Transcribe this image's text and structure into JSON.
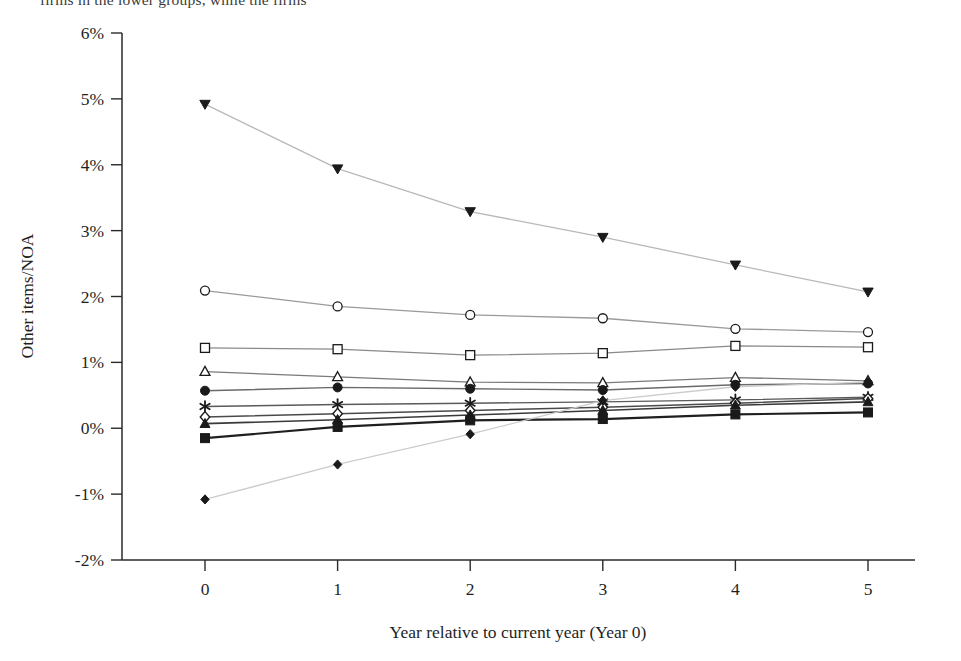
{
  "page": {
    "clipped_caption": "firms in the lower groups, while the firms"
  },
  "chart_data": {
    "type": "line",
    "title": "",
    "xlabel": "Year relative to current year (Year 0)",
    "ylabel": "Other items/NOA",
    "x": [
      0,
      1,
      2,
      3,
      4,
      5
    ],
    "xtick_labels": [
      "0",
      "1",
      "2",
      "3",
      "4",
      "5"
    ],
    "ytick_labels": [
      "6%",
      "5%",
      "4%",
      "3%",
      "2%",
      "1%",
      "0%",
      "-1%",
      "-2%"
    ],
    "ytick_values": [
      6,
      5,
      4,
      3,
      2,
      1,
      0,
      -1,
      -2
    ],
    "ylim": [
      -2,
      6
    ],
    "xlim": [
      -0.55,
      5.55
    ],
    "yunit": "percent",
    "grid": false,
    "legend": "none",
    "series": [
      {
        "name": "Portfolio 10",
        "marker": "triangle-down-filled",
        "color": "#1a1a1a",
        "line_color": "#b8b8b8",
        "line_width": 1.3,
        "marker_size": 9,
        "values": [
          4.92,
          3.94,
          3.29,
          2.9,
          2.48,
          2.07
        ]
      },
      {
        "name": "Portfolio 9",
        "marker": "circle-open",
        "color": "#1a1a1a",
        "line_color": "#9a9a9a",
        "line_width": 1.3,
        "marker_size": 9,
        "values": [
          2.09,
          1.85,
          1.72,
          1.67,
          1.51,
          1.46
        ]
      },
      {
        "name": "Portfolio 8",
        "marker": "square-open",
        "color": "#1a1a1a",
        "line_color": "#8a8a8a",
        "line_width": 1.3,
        "marker_size": 9,
        "values": [
          1.22,
          1.2,
          1.11,
          1.14,
          1.25,
          1.23
        ]
      },
      {
        "name": "Portfolio 7",
        "marker": "triangle-up-open",
        "color": "#1a1a1a",
        "line_color": "#7a7a7a",
        "line_width": 1.3,
        "marker_size": 9,
        "values": [
          0.86,
          0.78,
          0.7,
          0.69,
          0.77,
          0.72
        ]
      },
      {
        "name": "Portfolio 6",
        "marker": "circle-filled",
        "color": "#1a1a1a",
        "line_color": "#6a6a6a",
        "line_width": 1.4,
        "marker_size": 9,
        "values": [
          0.57,
          0.62,
          0.6,
          0.58,
          0.66,
          0.68
        ]
      },
      {
        "name": "Portfolio 5",
        "marker": "asterisk",
        "color": "#1a1a1a",
        "line_color": "#5a5a5a",
        "line_width": 1.4,
        "marker_size": 9,
        "values": [
          0.33,
          0.36,
          0.38,
          0.4,
          0.43,
          0.47
        ]
      },
      {
        "name": "Portfolio 4",
        "marker": "diamond-open",
        "color": "#1a1a1a",
        "line_color": "#4a4a4a",
        "line_width": 1.5,
        "marker_size": 9,
        "values": [
          0.17,
          0.22,
          0.27,
          0.32,
          0.38,
          0.45
        ]
      },
      {
        "name": "Portfolio 3",
        "marker": "triangle-up-filled",
        "color": "#1a1a1a",
        "line_color": "#3a3a3a",
        "line_width": 1.6,
        "marker_size": 9,
        "values": [
          0.07,
          0.13,
          0.2,
          0.27,
          0.35,
          0.4
        ]
      },
      {
        "name": "Portfolio 2",
        "marker": "square-filled",
        "color": "#1a1a1a",
        "line_color": "#1f1f1f",
        "line_width": 2.2,
        "marker_size": 9,
        "values": [
          -0.15,
          0.02,
          0.12,
          0.14,
          0.21,
          0.24
        ]
      },
      {
        "name": "Portfolio 1",
        "marker": "diamond-filled",
        "color": "#1a1a1a",
        "line_color": "#cccccc",
        "line_width": 1.3,
        "marker_size": 8,
        "values": [
          -1.08,
          -0.55,
          -0.09,
          0.42,
          0.63,
          0.7
        ]
      }
    ]
  },
  "plot_geometry": {
    "left": 122,
    "right": 915,
    "top": 33,
    "bottom": 560,
    "x0": 205,
    "x_step": 132.6
  }
}
